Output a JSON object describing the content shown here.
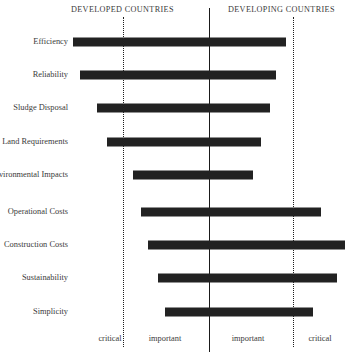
{
  "chart_data": {
    "type": "bar",
    "title": "",
    "subtitle": "",
    "orientation": "horizontal-diverging",
    "xlabel": "",
    "ylabel": "",
    "grid": false,
    "legend_position": "none",
    "group_headers": [
      {
        "id": "developed",
        "label": "DEVELOPED COUNTRIES",
        "side": "left"
      },
      {
        "id": "developing",
        "label": "DEVELOPING COUNTRIES",
        "side": "right"
      }
    ],
    "axis_scale": {
      "center_value": 0,
      "center_label": "",
      "left_extreme_label": "critical",
      "left_mid_label": "important",
      "right_mid_label": "important",
      "right_extreme_label": "critical",
      "xlim": [
        -2,
        2
      ],
      "tick_values": [
        -2,
        -1,
        1,
        2
      ],
      "tick_labels": [
        "critical",
        "important",
        "important",
        "critical"
      ],
      "reference_lines": [
        -1.6,
        1.6
      ]
    },
    "categories": [
      "Efficiency",
      "Reliability",
      "Sludge Disposal",
      "Land Requirements",
      "Environmental Impacts",
      "Operational Costs",
      "Construction Costs",
      "Sustainability",
      "Simplicity"
    ],
    "bars": [
      {
        "category": "Efficiency",
        "start": -1.61,
        "end": 0.9,
        "px_start": 73,
        "px_end": 286,
        "px_center_y": 42
      },
      {
        "category": "Reliability",
        "start": -1.52,
        "end": 0.79,
        "px_start": 80,
        "px_end": 276,
        "px_center_y": 75
      },
      {
        "category": "Sludge Disposal",
        "start": -1.31,
        "end": 0.72,
        "px_start": 97,
        "px_end": 270,
        "px_center_y": 108
      },
      {
        "category": "Land Requirements",
        "start": -1.2,
        "end": 0.61,
        "px_start": 107,
        "px_end": 261,
        "px_center_y": 142
      },
      {
        "category": "Environmental Impacts",
        "start": -0.9,
        "end": 0.51,
        "px_start": 133,
        "px_end": 253,
        "px_center_y": 175
      },
      {
        "category": "Operational Costs",
        "start": -0.8,
        "end": 1.32,
        "px_start": 141,
        "px_end": 321,
        "px_center_y": 212
      },
      {
        "category": "Construction Costs",
        "start": -0.71,
        "end": 1.6,
        "px_start": 148,
        "px_end": 345,
        "px_center_y": 245
      },
      {
        "category": "Sustainability",
        "start": -0.6,
        "end": 1.5,
        "px_start": 158,
        "px_end": 337,
        "px_center_y": 278
      },
      {
        "category": "Simplicity",
        "start": -0.52,
        "end": 1.22,
        "px_start": 165,
        "px_end": 313,
        "px_center_y": 312
      }
    ],
    "bar_color": "#222222",
    "axis_color": "#1a1a1a",
    "reference_line_color": "#1d1d1d",
    "background_color": "#ffffff"
  }
}
